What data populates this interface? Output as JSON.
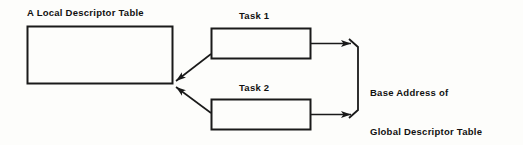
{
  "diagram": {
    "type": "block-diagram",
    "background_color": "#fdfdfb",
    "stroke_color": "#1a1a1a",
    "boxes": [
      {
        "id": "local-descriptor-table",
        "label": "A Local Descriptor Table",
        "label_position": "above-left",
        "x": 27,
        "y": 26,
        "width": 145,
        "height": 57
      },
      {
        "id": "task-1",
        "label": "Task 1",
        "label_position": "above-center",
        "x": 211,
        "y": 28,
        "width": 99,
        "height": 30
      },
      {
        "id": "task-2",
        "label": "Task 2",
        "label_position": "above-center",
        "x": 211,
        "y": 99,
        "width": 99,
        "height": 30
      }
    ],
    "annotations": [
      {
        "id": "base-address-note",
        "lines": [
          "Base Address of",
          "Global Descriptor Table"
        ],
        "x": 370,
        "y": 60
      }
    ],
    "brace": {
      "id": "right-brace",
      "orientation": "right",
      "top_y": 43,
      "bottom_y": 121,
      "x": 358,
      "tip_x": 349
    },
    "arrows": [
      {
        "id": "task1-to-ldt",
        "from": "task-1",
        "to": "local-descriptor-table",
        "direction": "left-down"
      },
      {
        "id": "task2-to-ldt",
        "from": "task-2",
        "to": "local-descriptor-table",
        "direction": "left-up"
      },
      {
        "id": "task1-to-brace",
        "from": "task-1",
        "to": "right-brace",
        "direction": "right"
      },
      {
        "id": "task2-to-brace",
        "from": "task-2",
        "to": "right-brace",
        "direction": "right"
      }
    ]
  },
  "labels": {
    "local_descriptor_table": "A Local Descriptor Table",
    "task_1": "Task 1",
    "task_2": "Task 2",
    "base_address_line1": "Base Address of",
    "base_address_line2": "Global Descriptor Table"
  }
}
